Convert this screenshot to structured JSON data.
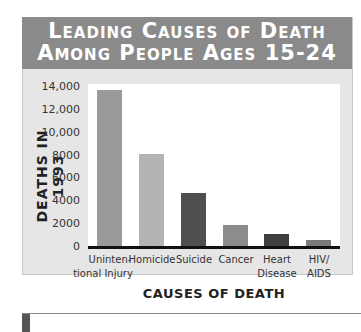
{
  "chart_data": {
    "type": "bar",
    "title": "Leading Causes of Death Among People Ages 15-24",
    "title_lines": [
      "Leading Causes of Death",
      "Among People Ages 15-24"
    ],
    "xlabel": "CAUSES OF DEATH",
    "ylabel": "DEATHS IN 1993",
    "categories": [
      "Unintentional Injury",
      "Homicide",
      "Suicide",
      "Cancer",
      "Heart Disease",
      "HIV/AIDS"
    ],
    "category_labels": [
      [
        "Uninten-",
        "tional Injury"
      ],
      [
        "Homicide",
        ""
      ],
      [
        "Suicide",
        ""
      ],
      [
        "Cancer",
        ""
      ],
      [
        "Heart",
        "Disease"
      ],
      [
        "HIV/",
        "AIDS"
      ]
    ],
    "values": [
      13700,
      8100,
      4700,
      1950,
      1100,
      600
    ],
    "bar_colors": [
      "#9a9a9a",
      "#b4b4b4",
      "#4f4f4f",
      "#8c8c8c",
      "#3f3f3f",
      "#7a7a7a"
    ],
    "yticks": [
      "14,000",
      "12,000",
      "10,000",
      "8000",
      "6000",
      "4000",
      "2000",
      "0"
    ],
    "ylim": [
      0,
      14000
    ],
    "grid": false,
    "legend": "none"
  }
}
